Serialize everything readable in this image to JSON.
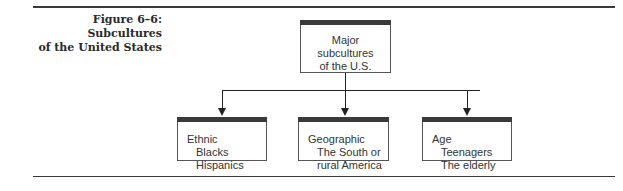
{
  "figure": {
    "caption_line1": "Figure 6–6: Subcultures",
    "caption_line2": "of the United States"
  },
  "diagram": {
    "root": {
      "line1": "Major",
      "line2": "subcultures",
      "line3": "of the U.S."
    },
    "children": [
      {
        "heading": "Ethnic",
        "items": [
          "Blacks",
          "Hispanics"
        ]
      },
      {
        "heading": "Geographic",
        "items": [
          "The South or",
          "rural America"
        ]
      },
      {
        "heading": "Age",
        "items": [
          "Teenagers",
          "The elderly"
        ]
      }
    ]
  }
}
